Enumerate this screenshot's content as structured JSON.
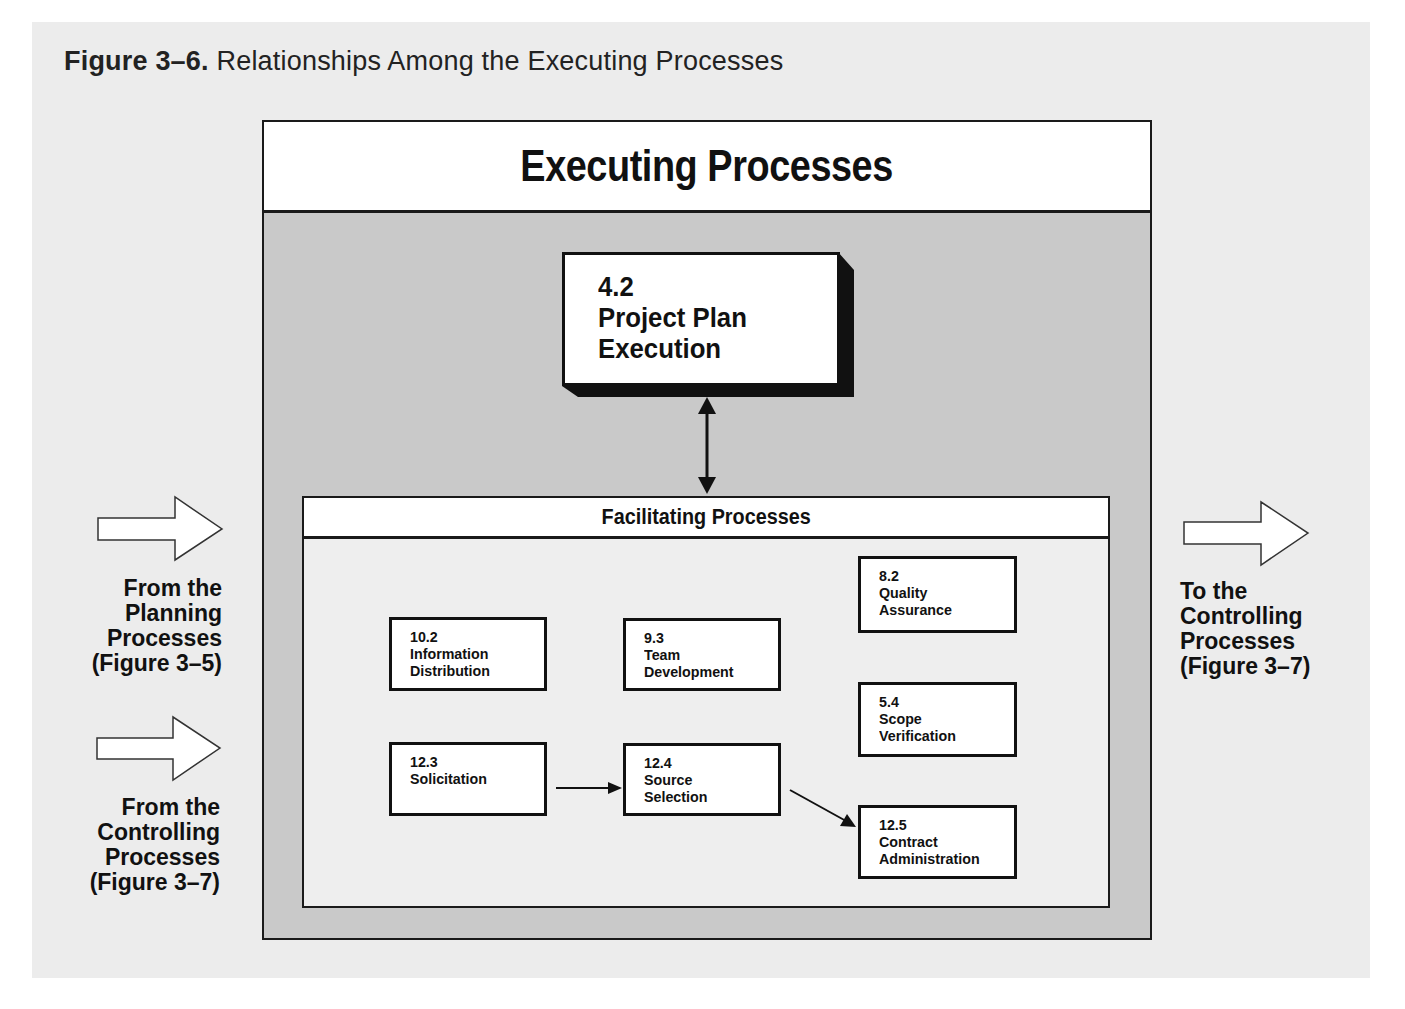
{
  "figure": {
    "caption_number": "Figure 3–6.",
    "caption_title": "Relationships Among the Executing Processes"
  },
  "executing": {
    "title": "Executing Processes",
    "core_process": {
      "number": "4.2",
      "line1": "Project Plan",
      "line2": "Execution"
    }
  },
  "facilitating": {
    "title": "Facilitating Processes",
    "processes": [
      {
        "id": "10.2",
        "line1": "Information",
        "line2": "Distribution"
      },
      {
        "id": "9.3",
        "line1": "Team",
        "line2": "Development"
      },
      {
        "id": "8.2",
        "line1": "Quality",
        "line2": "Assurance"
      },
      {
        "id": "5.4",
        "line1": "Scope",
        "line2": "Verification"
      },
      {
        "id": "12.3",
        "line1": "Solicitation",
        "line2": ""
      },
      {
        "id": "12.4",
        "line1": "Source",
        "line2": "Selection"
      },
      {
        "id": "12.5",
        "line1": "Contract",
        "line2": "Administration"
      }
    ],
    "flows": [
      {
        "from": "12.3",
        "to": "12.4"
      },
      {
        "from": "12.4",
        "to": "12.5"
      }
    ]
  },
  "inputs": [
    {
      "line1": "From the",
      "line2": "Planning",
      "line3": "Processes",
      "line4": "(Figure 3–5)"
    },
    {
      "line1": "From the",
      "line2": "Controlling",
      "line3": "Processes",
      "line4": "(Figure 3–7)"
    }
  ],
  "outputs": [
    {
      "line1": "To the",
      "line2": "Controlling",
      "line3": "Processes",
      "line4": "(Figure 3–7)"
    }
  ],
  "colors": {
    "figure_bg": "#ececec",
    "executing_body": "#c9c9c9",
    "facilitating_body": "#eeeeee",
    "box_fill": "#ffffff",
    "stroke": "#111111"
  }
}
